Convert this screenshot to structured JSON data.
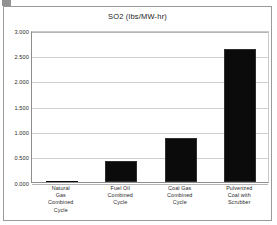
{
  "frame": {
    "border_color": "#9a9a9a"
  },
  "chart_data": {
    "type": "bar",
    "title": "SO2  (lbs/MW-hr)",
    "xlabel": "",
    "ylabel": "",
    "categories": [
      "Natural Gas Combined Cycle",
      "Fuel Oil Combined Cycle",
      "Coal Gas Combined Cycle",
      "Pulverized Coal with Scrubber"
    ],
    "category_lines": [
      [
        "Natural",
        "Gas",
        "Combined",
        "Cycle"
      ],
      [
        "Fuel Oil",
        "Combined",
        "Cycle"
      ],
      [
        "Coal Gas",
        "Combined",
        "Cycle"
      ],
      [
        "Pulverized",
        "Coal  with",
        "Scrubber"
      ]
    ],
    "values": [
      0.005,
      0.42,
      0.86,
      2.62
    ],
    "ylim": [
      0.0,
      3.0
    ],
    "yticks": [
      3.0,
      2.5,
      2.0,
      1.5,
      1.0,
      0.5,
      0.0
    ],
    "ytick_labels": [
      "3.000",
      "2.500",
      "2.000",
      "1.500",
      "1.000",
      "0.500",
      "0.000"
    ],
    "grid": true,
    "legend": false,
    "bar_color": "#0b0b0b",
    "gridline_color": "#cfcfcf",
    "axis_color": "#8d8d8d"
  }
}
